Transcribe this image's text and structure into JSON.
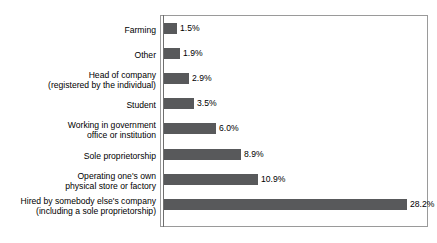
{
  "chart_data": {
    "type": "bar",
    "orientation": "horizontal",
    "title": "",
    "subtitle": "",
    "xlabel": "",
    "ylabel": "",
    "grid": false,
    "legend": false,
    "legend_position": "none",
    "value_suffix": "%",
    "xlim": [
      0,
      30.5
    ],
    "bar_color": "#58595B",
    "frame_color": "#9A9A9A",
    "axis_color": "#6F6F6F",
    "text_color": "#000000",
    "categories": [
      "Farming",
      "Other",
      "Head of company\n(registered by the individual)",
      "Student",
      "Working in government\noffice or institution",
      "Sole proprietorship",
      "Operating one's own\nphysical store or factory",
      "Hired by somebody else's company\n(including a sole proprietorship)"
    ],
    "values": [
      1.5,
      1.9,
      2.9,
      3.5,
      6.0,
      8.9,
      10.9,
      28.2
    ],
    "value_labels": [
      "1.5%",
      "1.9%",
      "2.9%",
      "3.5%",
      "6.0%",
      "8.9%",
      "10.9%",
      "28.2%"
    ]
  },
  "rows": [
    {
      "label": "Farming",
      "value_label": "1.5%"
    },
    {
      "label": "Other",
      "value_label": "1.9%"
    },
    {
      "label": "Head of company\n(registered by the individual)",
      "value_label": "2.9%"
    },
    {
      "label": "Student",
      "value_label": "3.5%"
    },
    {
      "label": "Working in government\noffice or institution",
      "value_label": "6.0%"
    },
    {
      "label": "Sole proprietorship",
      "value_label": "8.9%"
    },
    {
      "label": "Operating one's own\nphysical store or factory",
      "value_label": "10.9%"
    },
    {
      "label": "Hired by somebody else's company\n(including a sole proprietorship)",
      "value_label": "28.2%"
    }
  ]
}
